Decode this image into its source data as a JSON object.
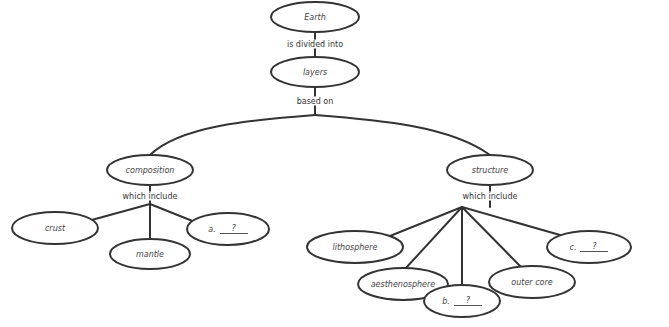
{
  "diagram": {
    "type": "concept-map",
    "nodes": {
      "earth": "Earth",
      "layers": "layers",
      "composition": "composition",
      "structure": "structure",
      "crust": "crust",
      "mantle": "mantle",
      "a_prefix": "a.",
      "a_blank": "?",
      "lithosphere": "lithosphere",
      "aesthenosphere": "aesthenosphere",
      "b_prefix": "b.",
      "b_blank": "?",
      "outer_core": "outer core",
      "c_prefix": "c.",
      "c_blank": "?"
    },
    "links": {
      "earth_layers": "is divided into",
      "layers_branches": "based on",
      "composition_children": "which include",
      "structure_children": "which include"
    }
  }
}
